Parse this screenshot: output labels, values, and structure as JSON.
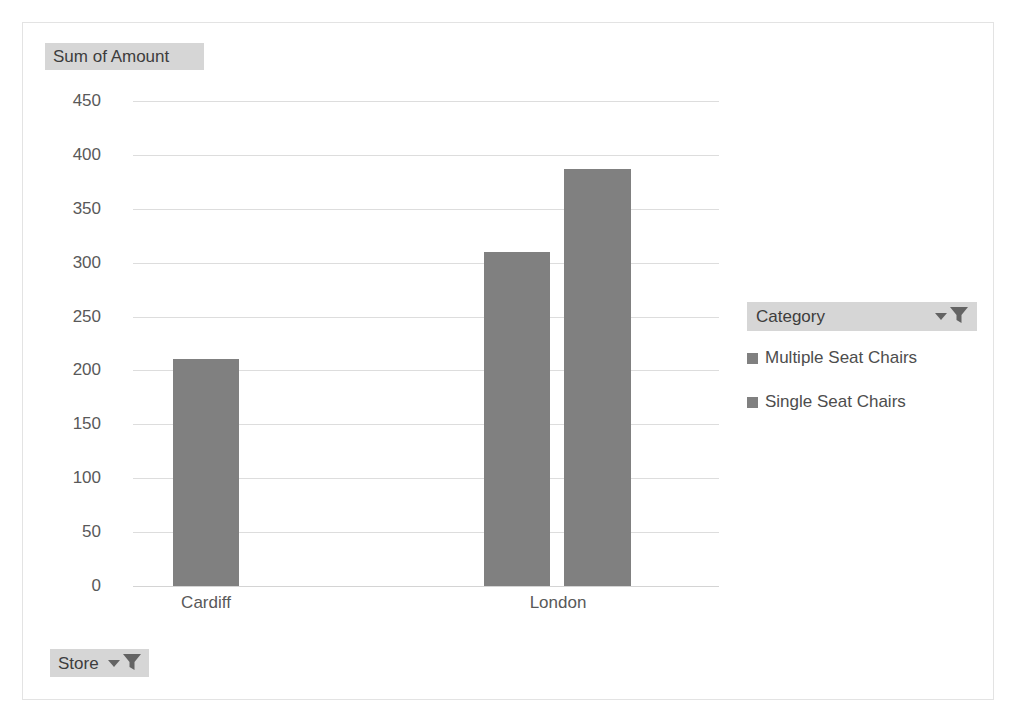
{
  "chart_data": {
    "type": "bar",
    "title": "",
    "value_field_label": "Sum of Amount",
    "xlabel": "",
    "ylabel": "Sum of Amount",
    "categories": [
      "Cardiff",
      "London"
    ],
    "series": [
      {
        "name": "Multiple Seat Chairs",
        "values": [
          211,
          310
        ]
      },
      {
        "name": "Single Seat Chairs",
        "values": [
          null,
          387
        ]
      }
    ],
    "ylim": [
      0,
      450
    ],
    "yticks": [
      0,
      50,
      100,
      150,
      200,
      250,
      300,
      350,
      400,
      450
    ],
    "ytick_labels": [
      "0",
      "50",
      "100",
      "150",
      "200",
      "250",
      "300",
      "350",
      "400",
      "450"
    ],
    "grid": true,
    "legend_position": "right",
    "bar_color": "#808080",
    "gridline_color": "#dddddd",
    "axis_text_color": "#595959"
  },
  "value_field": {
    "label": "Sum of Amount"
  },
  "legend": {
    "filter_button": {
      "label": "Category",
      "caret_icon": "chevron-down-icon",
      "filter_icon": "funnel-filter-icon"
    },
    "items": [
      {
        "label": "Multiple Seat Chairs",
        "color": "#808080"
      },
      {
        "label": "Single Seat Chairs",
        "color": "#808080"
      }
    ]
  },
  "axis_filter": {
    "label": "Store",
    "caret_icon": "chevron-down-icon",
    "filter_icon": "funnel-filter-icon"
  },
  "bars": [
    {
      "id": "cardiff-multiple-seat-chairs",
      "category": "Cardiff",
      "series": "Multiple Seat Chairs",
      "value": 211
    },
    {
      "id": "london-multiple-seat-chairs",
      "category": "London",
      "series": "Multiple Seat Chairs",
      "value": 310
    },
    {
      "id": "london-single-seat-chairs",
      "category": "London",
      "series": "Single Seat Chairs",
      "value": 387
    }
  ],
  "x_labels": [
    "Cardiff",
    "London"
  ]
}
